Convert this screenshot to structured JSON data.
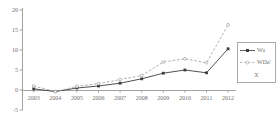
{
  "chart_data": {
    "type": "line",
    "title": "",
    "xlabel": "",
    "ylabel": "",
    "grid": false,
    "x": [
      2003,
      2004,
      2005,
      2006,
      2007,
      2008,
      2009,
      2010,
      2011,
      2012
    ],
    "x_tick_labels": [
      "2003",
      "2004",
      "2005",
      "2006",
      "2007",
      "2008",
      "2009",
      "2010",
      "2011",
      "2012"
    ],
    "ylim": [
      -5,
      20
    ],
    "yticks": [
      -5,
      0,
      5,
      10,
      15,
      20
    ],
    "ytick_labels": [
      "-5",
      "0",
      "5",
      "10",
      "15",
      "20"
    ],
    "series": [
      {
        "name": "Wa",
        "values": [
          0.3,
          -0.4,
          0.5,
          1.0,
          1.7,
          2.8,
          4.2,
          5.0,
          4.3,
          10.3
        ],
        "line_style": "solid",
        "marker": "square",
        "color": "#3c3c3c"
      },
      {
        "name": "WDa'",
        "values": [
          1.0,
          -0.4,
          0.9,
          1.6,
          2.6,
          3.6,
          7.0,
          7.8,
          6.8,
          16.3
        ],
        "line_style": "dashed",
        "marker": "circle",
        "color": "#a6a6a6"
      }
    ],
    "legend": {
      "position": "right",
      "entries": [
        {
          "label": "Wa"
        },
        {
          "label": "WDa'"
        },
        {
          "label": "X"
        }
      ]
    }
  },
  "colors": {
    "background": "#ffffff",
    "axis": "#8a8a8a",
    "tick_text": "#6f6f6f",
    "legend_border": "#a9a9a9",
    "series_solid": "#3c3c3c",
    "series_dashed": "#a6a6a6"
  }
}
